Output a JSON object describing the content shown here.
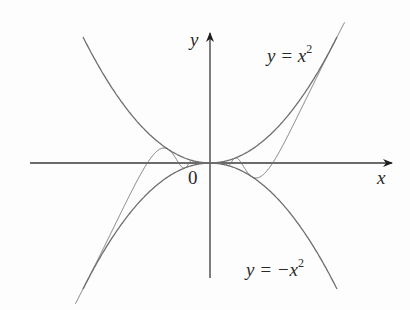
{
  "chart_data": {
    "type": "line",
    "title": "",
    "xlabel": "x",
    "ylabel": "y",
    "origin_label": "0",
    "grid": false,
    "legend": null,
    "series": [
      {
        "name": "y = x^2",
        "label_text": "y = x",
        "label_sup": "2",
        "formula": "x^2",
        "role": "upper bound"
      },
      {
        "name": "y = -x^2",
        "label_text": "y = −x",
        "label_sup": "2",
        "formula": "-x^2",
        "role": "lower bound"
      },
      {
        "name": "oscillating",
        "formula": "x^2 sin(1/x)",
        "role": "squeezed function"
      }
    ],
    "colors": {
      "curve": "#6e6e6e",
      "axis": "#3a3a3a",
      "text": "#2a2a2a"
    }
  },
  "labels": {
    "y_axis": "y",
    "x_axis": "x",
    "origin": "0",
    "upper_main": "y = x",
    "upper_sup": "2",
    "lower_main": "y = −x",
    "lower_sup": "2"
  }
}
